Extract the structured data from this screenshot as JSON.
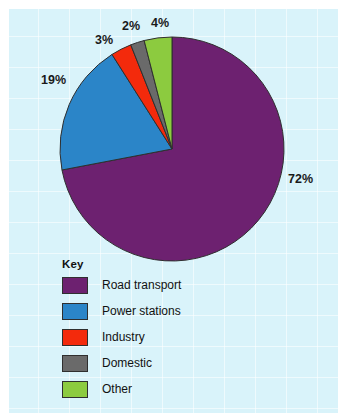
{
  "figure": {
    "background_color": "#ffffff",
    "panel_color": "#d9f3fa"
  },
  "legend": {
    "title": "Key"
  },
  "chart_data": {
    "type": "pie",
    "title": "",
    "subtitle": "",
    "xlabel": "",
    "ylabel": "",
    "legend_position": "inside-bottom-left",
    "grid": true,
    "units": "percent",
    "total": 100,
    "start_angle_deg": 0,
    "direction": "clockwise",
    "categories": [
      "Road transport",
      "Power stations",
      "Industry",
      "Domestic",
      "Other"
    ],
    "values": [
      72,
      19,
      3,
      2,
      4
    ],
    "colors": [
      "#6d2170",
      "#2b85c8",
      "#f32a0c",
      "#6a6a6a",
      "#8ccb3f"
    ],
    "data_labels": [
      "72%",
      "19%",
      "3%",
      "2%",
      "4%"
    ],
    "slices": [
      {
        "label": "Road transport",
        "value": 72,
        "data_label": "72%",
        "color": "#6d2170"
      },
      {
        "label": "Power stations",
        "value": 19,
        "data_label": "19%",
        "color": "#2b85c8"
      },
      {
        "label": "Industry",
        "value": 3,
        "data_label": "3%",
        "color": "#f32a0c"
      },
      {
        "label": "Domestic",
        "value": 2,
        "data_label": "2%",
        "color": "#6a6a6a"
      },
      {
        "label": "Other",
        "value": 4,
        "data_label": "4%",
        "color": "#8ccb3f"
      }
    ]
  }
}
